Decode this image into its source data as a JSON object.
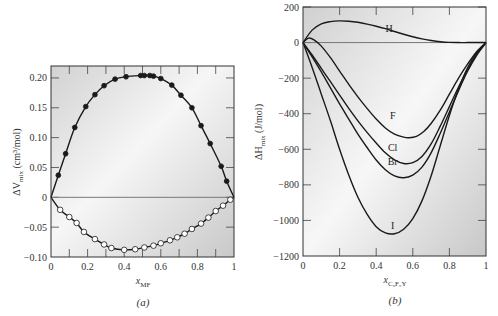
{
  "chart_data": [
    {
      "type": "scatter",
      "panel_label": "(a)",
      "title": "",
      "xlabel": "x_MF",
      "xlabel_main": "x",
      "xlabel_sub": "MF",
      "ylabel": "ΔV_mix (cm³/mol)",
      "xlim": [
        0,
        1
      ],
      "ylim": [
        -0.1,
        0.22
      ],
      "xticks": [
        0,
        0.2,
        0.4,
        0.6,
        0.8,
        1
      ],
      "xtick_labels": [
        "0",
        "0.2",
        "0.4",
        "0.6",
        "0.8",
        "1"
      ],
      "yticks": [
        -0.1,
        -0.05,
        0,
        0.05,
        0.1,
        0.15,
        0.2
      ],
      "ytick_labels": [
        "−0.10",
        "−0.05",
        "0",
        "0.05",
        "0.10",
        "0.15",
        "0.20"
      ],
      "grid": false,
      "zero_line": true,
      "series": [
        {
          "name": "positive (filled circles)",
          "marker": "filled-circle",
          "x": [
            0.0,
            0.04,
            0.08,
            0.13,
            0.19,
            0.24,
            0.29,
            0.35,
            0.41,
            0.49,
            0.51,
            0.54,
            0.56,
            0.6,
            0.66,
            0.71,
            0.77,
            0.82,
            0.87,
            0.93,
            0.96,
            1.0
          ],
          "y": [
            0.0,
            0.037,
            0.073,
            0.117,
            0.152,
            0.172,
            0.187,
            0.198,
            0.202,
            0.204,
            0.204,
            0.204,
            0.203,
            0.199,
            0.188,
            0.171,
            0.15,
            0.12,
            0.09,
            0.052,
            0.027,
            0.0
          ],
          "marker_mask": [
            false,
            true,
            true,
            true,
            true,
            true,
            true,
            true,
            true,
            true,
            true,
            true,
            true,
            true,
            true,
            true,
            true,
            true,
            true,
            true,
            true,
            false
          ]
        },
        {
          "name": "negative (open circles)",
          "marker": "open-circle",
          "x": [
            0.0,
            0.05,
            0.1,
            0.14,
            0.18,
            0.24,
            0.29,
            0.33,
            0.4,
            0.46,
            0.51,
            0.56,
            0.6,
            0.65,
            0.69,
            0.73,
            0.77,
            0.82,
            0.86,
            0.9,
            0.94,
            0.98,
            1.0
          ],
          "y": [
            0.0,
            -0.021,
            -0.033,
            -0.043,
            -0.058,
            -0.07,
            -0.079,
            -0.085,
            -0.088,
            -0.087,
            -0.084,
            -0.081,
            -0.077,
            -0.072,
            -0.067,
            -0.061,
            -0.053,
            -0.044,
            -0.034,
            -0.023,
            -0.014,
            -0.004,
            0.0
          ],
          "marker_mask": [
            false,
            true,
            true,
            true,
            true,
            true,
            true,
            true,
            true,
            true,
            true,
            true,
            true,
            true,
            true,
            true,
            true,
            true,
            true,
            true,
            true,
            true,
            false
          ]
        }
      ]
    },
    {
      "type": "line",
      "panel_label": "(b)",
      "title": "",
      "xlabel": "x_C6F5Y",
      "xlabel_main": "x",
      "xlabel_sub": "C₆F₅Y",
      "ylabel": "ΔH_mix (J/mol)",
      "xlim": [
        0,
        1
      ],
      "ylim": [
        -1200,
        200
      ],
      "xticks": [
        0,
        0.2,
        0.4,
        0.6,
        0.8,
        1
      ],
      "xtick_labels": [
        "0",
        "0.2",
        "0.4",
        "0.6",
        "0.8",
        "1"
      ],
      "yticks": [
        -1200,
        -1000,
        -800,
        -600,
        -400,
        -200,
        0,
        200
      ],
      "ytick_labels": [
        "−1200",
        "−1000",
        "−800",
        "−600",
        "−400",
        "−200",
        "0",
        "200"
      ],
      "grid": false,
      "zero_line": true,
      "series": [
        {
          "name": "H",
          "label_pos": [
            0.47,
            80
          ],
          "x": [
            0,
            0.05,
            0.1,
            0.15,
            0.2,
            0.25,
            0.3,
            0.35,
            0.4,
            0.45,
            0.5,
            0.55,
            0.6,
            0.65,
            0.7,
            0.75,
            0.8,
            0.85,
            0.9,
            0.95,
            1.0
          ],
          "y": [
            0,
            70,
            105,
            118,
            122,
            120,
            114,
            104,
            92,
            78,
            62,
            47,
            33,
            21,
            12,
            5,
            1,
            0,
            0,
            0,
            0
          ]
        },
        {
          "name": "F",
          "label_pos": [
            0.49,
            -410
          ],
          "x": [
            0,
            0.03,
            0.06,
            0.1,
            0.15,
            0.2,
            0.25,
            0.3,
            0.35,
            0.4,
            0.45,
            0.5,
            0.55,
            0.58,
            0.62,
            0.66,
            0.7,
            0.75,
            0.8,
            0.85,
            0.9,
            0.95,
            1.0
          ],
          "y": [
            0,
            25,
            15,
            -20,
            -85,
            -160,
            -235,
            -305,
            -370,
            -430,
            -480,
            -515,
            -532,
            -535,
            -527,
            -500,
            -455,
            -380,
            -290,
            -200,
            -120,
            -50,
            0
          ]
        },
        {
          "name": "Cl",
          "label_pos": [
            0.49,
            -590
          ],
          "x": [
            0,
            0.05,
            0.1,
            0.15,
            0.2,
            0.25,
            0.3,
            0.35,
            0.4,
            0.45,
            0.5,
            0.55,
            0.6,
            0.65,
            0.7,
            0.75,
            0.8,
            0.85,
            0.9,
            0.95,
            1.0
          ],
          "y": [
            0,
            -70,
            -145,
            -220,
            -295,
            -370,
            -440,
            -505,
            -565,
            -620,
            -660,
            -680,
            -675,
            -640,
            -570,
            -470,
            -360,
            -250,
            -150,
            -65,
            0
          ]
        },
        {
          "name": "Br",
          "label_pos": [
            0.49,
            -670
          ],
          "x": [
            0,
            0.05,
            0.1,
            0.15,
            0.2,
            0.25,
            0.3,
            0.35,
            0.4,
            0.45,
            0.5,
            0.55,
            0.6,
            0.65,
            0.7,
            0.75,
            0.8,
            0.85,
            0.9,
            0.95,
            1.0
          ],
          "y": [
            0,
            -80,
            -165,
            -255,
            -345,
            -430,
            -515,
            -590,
            -660,
            -715,
            -750,
            -760,
            -745,
            -700,
            -620,
            -510,
            -390,
            -270,
            -160,
            -70,
            0
          ]
        },
        {
          "name": "I",
          "label_pos": [
            0.49,
            -1030
          ],
          "x": [
            0,
            0.05,
            0.1,
            0.15,
            0.2,
            0.25,
            0.3,
            0.35,
            0.4,
            0.45,
            0.5,
            0.55,
            0.6,
            0.65,
            0.7,
            0.75,
            0.8,
            0.85,
            0.9,
            0.95,
            1.0
          ],
          "y": [
            0,
            -140,
            -290,
            -440,
            -600,
            -745,
            -870,
            -965,
            -1035,
            -1070,
            -1075,
            -1050,
            -990,
            -890,
            -750,
            -580,
            -410,
            -260,
            -140,
            -55,
            0
          ]
        }
      ]
    }
  ],
  "panels": {
    "a": {
      "label": "(a)",
      "ylabel_main": "ΔV",
      "ylabel_sub": "mix",
      "ylabel_unit": " (cm³/mol)",
      "xlabel_main": "x",
      "xlabel_sub": "MF"
    },
    "b": {
      "label": "(b)",
      "ylabel_main": "ΔH",
      "ylabel_sub": "mix",
      "ylabel_unit": " (J/mol)",
      "xlabel_main": "x",
      "xlabel_sub": "C₆F₅Y"
    }
  },
  "colors": {
    "curve": "#1a1a1a",
    "frame": "#333333",
    "zero_line": "#777777",
    "bg_light": "#f7f7f7",
    "bg_dark": "#cfcfcf"
  }
}
